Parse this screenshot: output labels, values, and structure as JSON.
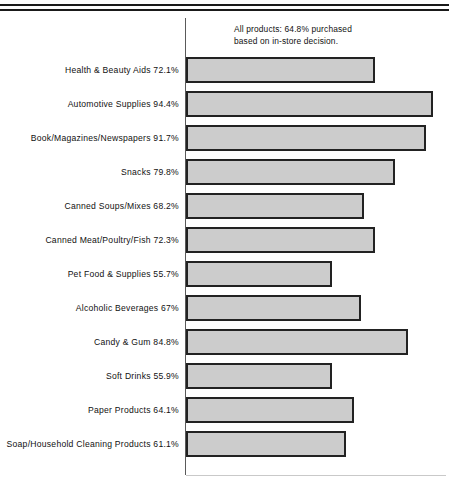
{
  "document": {
    "top_rule_count": 2
  },
  "annotation": {
    "line1": "All products:  64.8% purchased",
    "line2": "based on in-store decision."
  },
  "chart_data": {
    "type": "bar",
    "orientation": "horizontal",
    "title": "",
    "subtitle": "",
    "xlabel": "",
    "ylabel": "",
    "xlim": [
      0,
      100
    ],
    "grid": false,
    "legend": null,
    "unit": "%",
    "note": "All products:  64.8% purchased based on in-store decision.",
    "overall_average": 64.8,
    "categories": [
      "Health & Beauty Aids",
      "Automotive Supplies",
      "Book/Magazines/Newspapers",
      "Snacks",
      "Canned Soups/Mixes",
      "Canned Meat/Poultry/Fish",
      "Pet Food & Supplies",
      "Alcoholic Beverages",
      "Candy & Gum",
      "Soft Drinks",
      "Paper Products",
      "Soap/Household Cleaning Products"
    ],
    "values": [
      72.1,
      94.4,
      91.7,
      79.8,
      68.2,
      72.3,
      55.7,
      67,
      84.8,
      55.9,
      64.1,
      61.1
    ],
    "value_labels": [
      "72.1%",
      "94.4%",
      "91.7%",
      "79.8%",
      "68.2%",
      "72.3%",
      "55.7%",
      "67%",
      "84.8%",
      "55.9%",
      "64.1%",
      "61.1%"
    ],
    "rows": [
      {
        "category": "Health & Beauty Aids",
        "value": 72.1,
        "label": "Health & Beauty Aids 72.1%"
      },
      {
        "category": "Automotive Supplies",
        "value": 94.4,
        "label": "Automotive Supplies 94.4%"
      },
      {
        "category": "Book/Magazines/Newspapers",
        "value": 91.7,
        "label": "Book/Magazines/Newspapers 91.7%"
      },
      {
        "category": "Snacks",
        "value": 79.8,
        "label": "Snacks 79.8%"
      },
      {
        "category": "Canned Soups/Mixes",
        "value": 68.2,
        "label": "Canned Soups/Mixes 68.2%"
      },
      {
        "category": "Canned Meat/Poultry/Fish",
        "value": 72.3,
        "label": "Canned Meat/Poultry/Fish 72.3%"
      },
      {
        "category": "Pet Food & Supplies",
        "value": 55.7,
        "label": "Pet Food & Supplies 55.7%"
      },
      {
        "category": "Alcoholic Beverages",
        "value": 67,
        "label": "Alcoholic Beverages 67%"
      },
      {
        "category": "Candy & Gum",
        "value": 84.8,
        "label": "Candy & Gum 84.8%"
      },
      {
        "category": "Soft Drinks",
        "value": 55.9,
        "label": "Soft Drinks 55.9%"
      },
      {
        "category": "Paper Products",
        "value": 64.1,
        "label": "Paper Products 64.1%"
      },
      {
        "category": "Soap/Household Cleaning Products",
        "value": 61.1,
        "label": "Soap/Household Cleaning Products 61.1%"
      }
    ],
    "colors": {
      "bar_fill": "#cccccc",
      "bar_stroke": "#222222",
      "axis": "#5a5a5a",
      "rule": "#1a1a1a",
      "text": "#111111",
      "background": "#ffffff"
    },
    "layout": {
      "axis_x_px": 185,
      "px_per_percent": 2.617,
      "row_pitch_px": 34,
      "first_row_top_px": 43,
      "bar_height_px": 26
    }
  }
}
